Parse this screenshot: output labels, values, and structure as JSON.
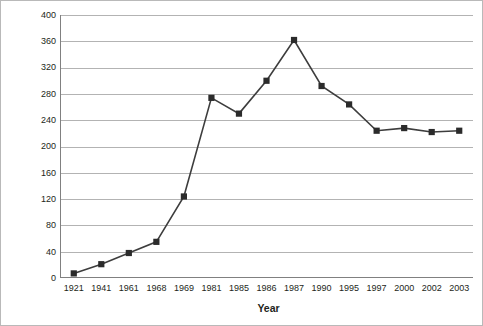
{
  "chart_data": {
    "type": "line",
    "title": "",
    "xlabel": "Year",
    "ylabel": "Divorces per 100,000",
    "categories": [
      "1921",
      "1941",
      "1961",
      "1968",
      "1969",
      "1981",
      "1985",
      "1986",
      "1987",
      "1990",
      "1995",
      "1997",
      "2000",
      "2002",
      "2003"
    ],
    "values": [
      7,
      21,
      38,
      55,
      124,
      274,
      250,
      300,
      362,
      292,
      264,
      224,
      228,
      222,
      224
    ],
    "series": [
      {
        "name": "Divorces per 100,000",
        "values": [
          7,
          21,
          38,
          55,
          124,
          274,
          250,
          300,
          362,
          292,
          264,
          224,
          228,
          222,
          224
        ]
      }
    ],
    "ylim": [
      0,
      400
    ],
    "ytick_step": 40,
    "yticks": [
      "400",
      "360",
      "320",
      "280",
      "240",
      "200",
      "160",
      "120",
      "80",
      "40",
      "0"
    ],
    "grid": "horizontal",
    "legend": "none",
    "line_color": "#3d3d3d",
    "marker_color": "#2b2b2b",
    "marker": "square",
    "grid_color": "#b3b3b3",
    "axis_color": "#808080",
    "background": "#ffffff"
  }
}
